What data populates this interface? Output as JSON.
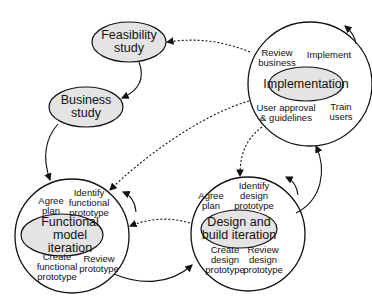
{
  "nodes": {
    "feasibility": {
      "line1": "Feasibility",
      "line2": "study"
    },
    "business": {
      "line1": "Business",
      "line2": "study"
    },
    "functional": {
      "title1": "Functional",
      "title2": "model",
      "title3": "iteration",
      "agree1": "Agree",
      "agree2": "plan",
      "identify1": "Identify",
      "identify2": "functional",
      "identify3": "prototype",
      "create1": "Create",
      "create2": "functional",
      "create3": "prototype",
      "review1": "Review",
      "review2": "prototype"
    },
    "design": {
      "title1": "Design and",
      "title2": "build iteration",
      "agree1": "Agree",
      "agree2": "plan",
      "identify1": "Identify",
      "identify2": "design",
      "identify3": "prototype",
      "create1": "Create",
      "create2": "design",
      "create3": "prototype",
      "review1": "Review",
      "review2": "design",
      "review3": "prototype"
    },
    "implementation": {
      "title": "Implementation",
      "review1": "Review",
      "review2": "business",
      "implement": "Implement",
      "approval1": "User approval",
      "approval2": "& guidelines",
      "train1": "Train",
      "train2": "users"
    }
  },
  "colors": {
    "fill": "#e4e4e4",
    "stroke": "#111111"
  }
}
